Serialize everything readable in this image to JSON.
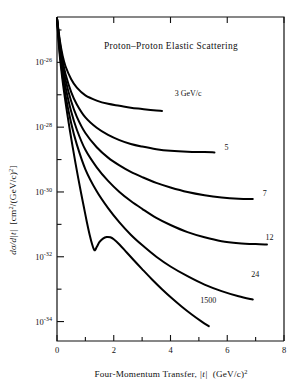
{
  "figure": {
    "title": "Proton–Proton Elastic Scattering",
    "background_color": "#ffffff",
    "ink_color": "#000000"
  },
  "axes": {
    "x": {
      "label_main": "Four-Momentum Transfer,",
      "label_symbol": "|t|",
      "label_units": "(GeV/c)",
      "label_units_exponent": "2",
      "min": 0,
      "max": 8,
      "major_ticks": [
        0,
        2,
        4,
        6,
        8
      ],
      "major_tick_labels": [
        "0",
        "2",
        "4",
        "6",
        "8"
      ],
      "minor_ticks": [
        1,
        3,
        5,
        7
      ]
    },
    "y": {
      "label_symbol": "dσ/d|t|",
      "label_units": "[cm",
      "label_units_sup1": "2",
      "label_units_mid": "/(GeV/c)",
      "label_units_sup2": "2",
      "label_units_end": "]",
      "scale": "log10",
      "min_exponent": -34.6,
      "max_exponent": -24.6,
      "major_tick_exponents": [
        -26,
        -28,
        -30,
        -32,
        -34
      ],
      "major_tick_mantissa": "10",
      "major_tick_labels": [
        "-26",
        "-28",
        "-30",
        "-32",
        "-34"
      ],
      "minor_tick_exponents": [
        -25,
        -27,
        -29,
        -31,
        -33
      ]
    },
    "grid": false,
    "legend_position": "inline-curve-end-labels"
  },
  "chart_data": {
    "type": "line",
    "title": "Proton–Proton Elastic Scattering",
    "xlabel": "Four-Momentum Transfer, |t|  (GeV/c)^2",
    "ylabel": "dσ/d|t|  [cm^2/(GeV/c)^2]",
    "xlim": [
      0,
      8
    ],
    "ylim_exponent": [
      -34.6,
      -24.6
    ],
    "yscale": "log",
    "grid": false,
    "x_units": "(GeV/c)^2",
    "y_units": "cm^2/(GeV/c)^2",
    "series": [
      {
        "name": "3 GeV/c",
        "label": "3 GeV/c",
        "label_x": 4.15,
        "label_y_exponent": -27.05,
        "points": [
          [
            0.0,
            -24.65
          ],
          [
            0.1,
            -25.32
          ],
          [
            0.2,
            -25.8
          ],
          [
            0.3,
            -26.12
          ],
          [
            0.5,
            -26.52
          ],
          [
            0.7,
            -26.78
          ],
          [
            1.0,
            -27.02
          ],
          [
            1.4,
            -27.18
          ],
          [
            1.8,
            -27.28
          ],
          [
            2.2,
            -27.34
          ],
          [
            2.6,
            -27.4
          ],
          [
            3.0,
            -27.44
          ],
          [
            3.4,
            -27.48
          ],
          [
            3.7,
            -27.5
          ]
        ]
      },
      {
        "name": "5 GeV/c",
        "label": "5",
        "label_x": 5.9,
        "label_y_exponent": -28.72,
        "points": [
          [
            0.0,
            -24.65
          ],
          [
            0.1,
            -25.4
          ],
          [
            0.2,
            -25.95
          ],
          [
            0.3,
            -26.36
          ],
          [
            0.5,
            -26.92
          ],
          [
            0.7,
            -27.3
          ],
          [
            1.0,
            -27.7
          ],
          [
            1.4,
            -28.02
          ],
          [
            1.8,
            -28.24
          ],
          [
            2.2,
            -28.4
          ],
          [
            2.6,
            -28.52
          ],
          [
            3.0,
            -28.6
          ],
          [
            3.5,
            -28.68
          ],
          [
            4.0,
            -28.73
          ],
          [
            4.6,
            -28.76
          ],
          [
            5.2,
            -28.77
          ],
          [
            5.55,
            -28.78
          ]
        ]
      },
      {
        "name": "7 GeV/c",
        "label": "7",
        "label_x": 7.25,
        "label_y_exponent": -30.12,
        "points": [
          [
            0.0,
            -24.65
          ],
          [
            0.1,
            -25.48
          ],
          [
            0.2,
            -26.08
          ],
          [
            0.3,
            -26.54
          ],
          [
            0.5,
            -27.2
          ],
          [
            0.7,
            -27.68
          ],
          [
            1.0,
            -28.18
          ],
          [
            1.4,
            -28.62
          ],
          [
            1.8,
            -28.94
          ],
          [
            2.2,
            -29.18
          ],
          [
            2.6,
            -29.38
          ],
          [
            3.0,
            -29.54
          ],
          [
            3.5,
            -29.72
          ],
          [
            4.0,
            -29.86
          ],
          [
            4.6,
            -30.0
          ],
          [
            5.2,
            -30.1
          ],
          [
            5.8,
            -30.17
          ],
          [
            6.4,
            -30.21
          ],
          [
            6.9,
            -30.22
          ]
        ]
      },
      {
        "name": "12 GeV/c",
        "label": "12",
        "label_x": 7.35,
        "label_y_exponent": -31.48,
        "points": [
          [
            0.0,
            -24.65
          ],
          [
            0.1,
            -25.58
          ],
          [
            0.2,
            -26.24
          ],
          [
            0.3,
            -26.76
          ],
          [
            0.5,
            -27.52
          ],
          [
            0.7,
            -28.08
          ],
          [
            1.0,
            -28.7
          ],
          [
            1.4,
            -29.24
          ],
          [
            1.8,
            -29.66
          ],
          [
            2.2,
            -30.0
          ],
          [
            2.6,
            -30.28
          ],
          [
            3.0,
            -30.52
          ],
          [
            3.5,
            -30.8
          ],
          [
            4.0,
            -31.02
          ],
          [
            4.6,
            -31.24
          ],
          [
            5.2,
            -31.4
          ],
          [
            5.8,
            -31.52
          ],
          [
            6.4,
            -31.58
          ],
          [
            7.0,
            -31.61
          ],
          [
            7.4,
            -31.62
          ]
        ]
      },
      {
        "name": "24 GeV/c",
        "label": "24",
        "label_x": 6.85,
        "label_y_exponent": -32.62,
        "points": [
          [
            0.0,
            -24.65
          ],
          [
            0.1,
            -25.7
          ],
          [
            0.2,
            -26.44
          ],
          [
            0.3,
            -27.02
          ],
          [
            0.5,
            -27.88
          ],
          [
            0.7,
            -28.54
          ],
          [
            1.0,
            -29.3
          ],
          [
            1.4,
            -29.98
          ],
          [
            1.8,
            -30.5
          ],
          [
            2.2,
            -30.94
          ],
          [
            2.6,
            -31.32
          ],
          [
            3.0,
            -31.64
          ],
          [
            3.5,
            -32.0
          ],
          [
            4.0,
            -32.3
          ],
          [
            4.6,
            -32.6
          ],
          [
            5.2,
            -32.86
          ],
          [
            5.8,
            -33.06
          ],
          [
            6.4,
            -33.22
          ],
          [
            6.9,
            -33.32
          ]
        ]
      },
      {
        "name": "1500 GeV/c",
        "label": "1500",
        "label_x": 5.05,
        "label_y_exponent": -33.42,
        "has_diffraction_dip": true,
        "dip_position": 1.32,
        "dip_depth_exponent": -31.78,
        "secondary_max_position": 1.82,
        "secondary_max_exponent": -31.38,
        "points": [
          [
            0.0,
            -24.65
          ],
          [
            0.08,
            -25.62
          ],
          [
            0.16,
            -26.3
          ],
          [
            0.25,
            -26.92
          ],
          [
            0.35,
            -27.52
          ],
          [
            0.45,
            -28.08
          ],
          [
            0.55,
            -28.6
          ],
          [
            0.65,
            -29.1
          ],
          [
            0.75,
            -29.58
          ],
          [
            0.85,
            -30.04
          ],
          [
            0.95,
            -30.48
          ],
          [
            1.05,
            -30.92
          ],
          [
            1.15,
            -31.32
          ],
          [
            1.24,
            -31.62
          ],
          [
            1.32,
            -31.8
          ],
          [
            1.4,
            -31.7
          ],
          [
            1.5,
            -31.54
          ],
          [
            1.62,
            -31.44
          ],
          [
            1.75,
            -31.39
          ],
          [
            1.88,
            -31.4
          ],
          [
            2.0,
            -31.46
          ],
          [
            2.2,
            -31.62
          ],
          [
            2.45,
            -31.86
          ],
          [
            2.7,
            -32.1
          ],
          [
            3.0,
            -32.38
          ],
          [
            3.35,
            -32.7
          ],
          [
            3.7,
            -33.0
          ],
          [
            4.05,
            -33.28
          ],
          [
            4.4,
            -33.54
          ],
          [
            4.75,
            -33.78
          ],
          [
            5.1,
            -34.0
          ],
          [
            5.35,
            -34.14
          ]
        ]
      }
    ]
  }
}
